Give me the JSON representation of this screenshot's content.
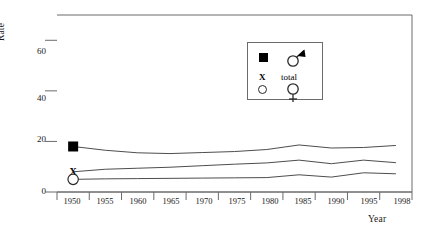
{
  "chart_data": {
    "type": "line",
    "title": "",
    "xlabel": "Year",
    "ylabel": "Rate",
    "xlim": [
      1950,
      1998
    ],
    "ylim": [
      0,
      70
    ],
    "yticks": [
      0,
      20,
      40,
      60
    ],
    "xticks": [
      1950,
      1955,
      1960,
      1965,
      1970,
      1975,
      1980,
      1985,
      1990,
      1995,
      1998
    ],
    "grid": false,
    "legend_position": "upper-center-right",
    "x": [
      1950,
      1955,
      1960,
      1965,
      1970,
      1975,
      1980,
      1985,
      1990,
      1995,
      1998
    ],
    "series": [
      {
        "name": "male",
        "symbol": "filled-square",
        "marker_years": [
          1950
        ],
        "values": [
          18.0,
          16.5,
          15.5,
          15.2,
          15.6,
          16.0,
          16.8,
          18.6,
          17.4,
          17.6,
          18.4
        ]
      },
      {
        "name": "total",
        "symbol": "x-mark",
        "marker_years": [
          1950
        ],
        "values": [
          8.0,
          9.0,
          9.4,
          9.8,
          10.4,
          11.0,
          11.5,
          12.6,
          11.2,
          12.6,
          11.6
        ]
      },
      {
        "name": "female",
        "symbol": "open-circle",
        "marker_years": [
          1950
        ],
        "values": [
          5.0,
          5.2,
          5.3,
          5.4,
          5.5,
          5.6,
          5.7,
          6.8,
          5.9,
          7.6,
          7.2
        ]
      }
    ]
  },
  "axes": {
    "y_title": "Rate",
    "x_title": "Year",
    "y_tick_labels": [
      "60",
      "40",
      "20",
      "0"
    ],
    "x_tick_labels": [
      "1950",
      "1955",
      "1960",
      "1965",
      "1970",
      "1975",
      "1980",
      "1985",
      "1990",
      "1995",
      "1998"
    ]
  },
  "legend": {
    "rows": [
      {
        "symbol_left": "filled-square",
        "symbol_right": "mars-symbol",
        "label_left": "",
        "label_right": ""
      },
      {
        "symbol_left": "x-mark",
        "symbol_right": "open-circle-venus",
        "label_left": "X",
        "label_right": "total"
      }
    ],
    "male_symbol": "♂",
    "female_symbol": "♀",
    "total_label": "total",
    "x_label": "X"
  },
  "markers": {
    "male_1950": {
      "symbol": "filled-square",
      "year": "1950",
      "value": "18"
    },
    "total_1950": {
      "symbol": "X",
      "year": "1950",
      "value": "8"
    },
    "female_1950": {
      "symbol": "open-circle",
      "year": "1950",
      "value": "5"
    }
  }
}
